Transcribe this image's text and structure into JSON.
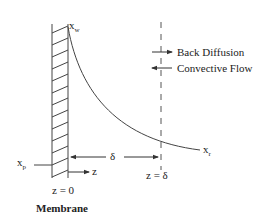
{
  "diagram": {
    "type": "concentration-polarization",
    "labels": {
      "xw": {
        "main": "x",
        "sub": "w"
      },
      "xp": {
        "main": "x",
        "sub": "p"
      },
      "xr": {
        "main": "x",
        "sub": "r"
      },
      "z_axis": "z",
      "z0": "z = 0",
      "zdelta": "z = δ",
      "delta": "δ",
      "membrane": "Membrane"
    },
    "legend": [
      {
        "label": "Back Diffusion",
        "direction": "right"
      },
      {
        "label": "Convective Flow",
        "direction": "left"
      }
    ],
    "colors": {
      "line": "#333333",
      "background": "#ffffff"
    }
  }
}
